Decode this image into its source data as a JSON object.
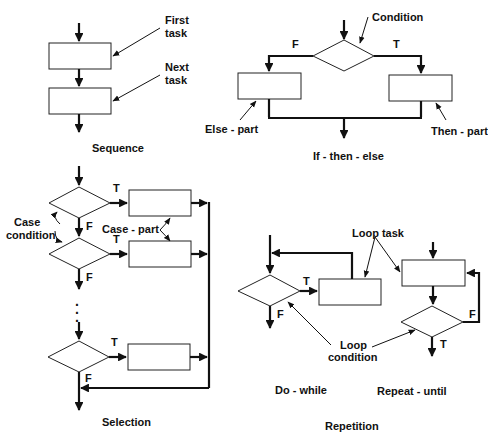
{
  "diagram": {
    "type": "flowchart-control-structures",
    "sequence": {
      "title": "Sequence",
      "labels": {
        "first_task": [
          "First",
          "task"
        ],
        "next_task": [
          "Next",
          "task"
        ]
      }
    },
    "if_then_else": {
      "title": "If - then - else",
      "labels": {
        "condition": "Condition",
        "false_branch": "F",
        "true_branch": "T",
        "else_part": "Else - part",
        "then_part": "Then - part"
      }
    },
    "selection": {
      "title": "Selection",
      "labels": {
        "case_condition": [
          "Case",
          "condition"
        ],
        "case_part": "Case - part",
        "true_label": "T",
        "false_label": "F",
        "ellipsis": "⋮"
      }
    },
    "repetition": {
      "title": "Repetition",
      "do_while": {
        "title": "Do - while",
        "true_label": "T",
        "false_label": "F"
      },
      "repeat_until": {
        "title": "Repeat - until",
        "true_label": "T",
        "false_label": "F"
      },
      "labels": {
        "loop_task": "Loop task",
        "loop_condition": [
          "Loop",
          "condition"
        ]
      }
    }
  }
}
